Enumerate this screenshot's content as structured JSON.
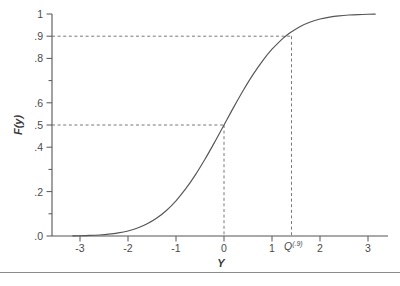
{
  "figure": {
    "name": "normal-cdf-quantile-figure",
    "background_color": "#ffffff",
    "line_color": "#555555",
    "dash_color": "#666666",
    "axis_color": "#555555",
    "footer_rule_color": "#8a8a8a"
  },
  "axes": {
    "x_title": "Y",
    "y_title": "F(y)",
    "x_tick_labels": [
      "-3",
      "-2",
      "-1",
      "0",
      "1",
      "2",
      "3"
    ],
    "x_tick_values": [
      -3,
      -2,
      -1,
      0,
      1,
      2,
      3
    ],
    "y_tick_labels": [
      "1",
      ".9",
      ".8",
      "",
      ".6",
      ".5",
      ".4",
      "",
      ".2",
      "",
      ".0"
    ],
    "y_tick_values": [
      1,
      0.9,
      0.8,
      0.7,
      0.6,
      0.5,
      0.4,
      0.3,
      0.2,
      0.1,
      0.0
    ]
  },
  "annotations": {
    "quantile_label_base": "Q",
    "quantile_label_sup": "(.9)",
    "quantile_x": 1.2816,
    "median_x": 0,
    "median_level": 0.5,
    "quantile_level": 0.9
  },
  "chart_data": {
    "type": "line",
    "title": "",
    "xlabel": "Y",
    "ylabel": "F(y)",
    "xlim": [
      -3.15,
      3.15
    ],
    "ylim": [
      0,
      1
    ],
    "grid": false,
    "legend": null,
    "series": [
      {
        "name": "Standard normal CDF F(y)",
        "x": [
          -3.15,
          -3.0,
          -2.8,
          -2.6,
          -2.4,
          -2.2,
          -2.0,
          -1.8,
          -1.6,
          -1.4,
          -1.2,
          -1.0,
          -0.8,
          -0.6,
          -0.4,
          -0.2,
          0.0,
          0.2,
          0.4,
          0.6,
          0.8,
          1.0,
          1.2,
          1.2816,
          1.4,
          1.6,
          1.8,
          2.0,
          2.2,
          2.4,
          2.6,
          2.8,
          3.0,
          3.15
        ],
        "y": [
          0.0008,
          0.0013,
          0.0026,
          0.0047,
          0.0082,
          0.0139,
          0.0228,
          0.0359,
          0.0548,
          0.0808,
          0.1151,
          0.1587,
          0.2119,
          0.2743,
          0.3446,
          0.4207,
          0.5,
          0.5793,
          0.6554,
          0.7257,
          0.7881,
          0.8413,
          0.8849,
          0.9,
          0.9192,
          0.9452,
          0.9641,
          0.9772,
          0.9861,
          0.9918,
          0.9953,
          0.9974,
          0.9987,
          0.9992
        ]
      }
    ],
    "reference_lines": [
      {
        "name": "median-horizontal",
        "type": "horizontal-dashed",
        "y": 0.5,
        "x_from": -3.15,
        "x_to": 0
      },
      {
        "name": "median-vertical",
        "type": "vertical-dashed",
        "x": 0,
        "y_from": 0,
        "y_to": 0.5
      },
      {
        "name": "quantile90-horizontal",
        "type": "horizontal-dashed",
        "y": 0.9,
        "x_from": -3.15,
        "x_to": 1.2816
      },
      {
        "name": "quantile90-vertical",
        "type": "vertical-dashed",
        "x": 1.2816,
        "y_from": 0,
        "y_to": 0.9
      }
    ],
    "annotations": [
      {
        "name": "quantile-tick-label",
        "text": "Q(.9)",
        "x": 1.2816,
        "y": 0
      }
    ]
  }
}
